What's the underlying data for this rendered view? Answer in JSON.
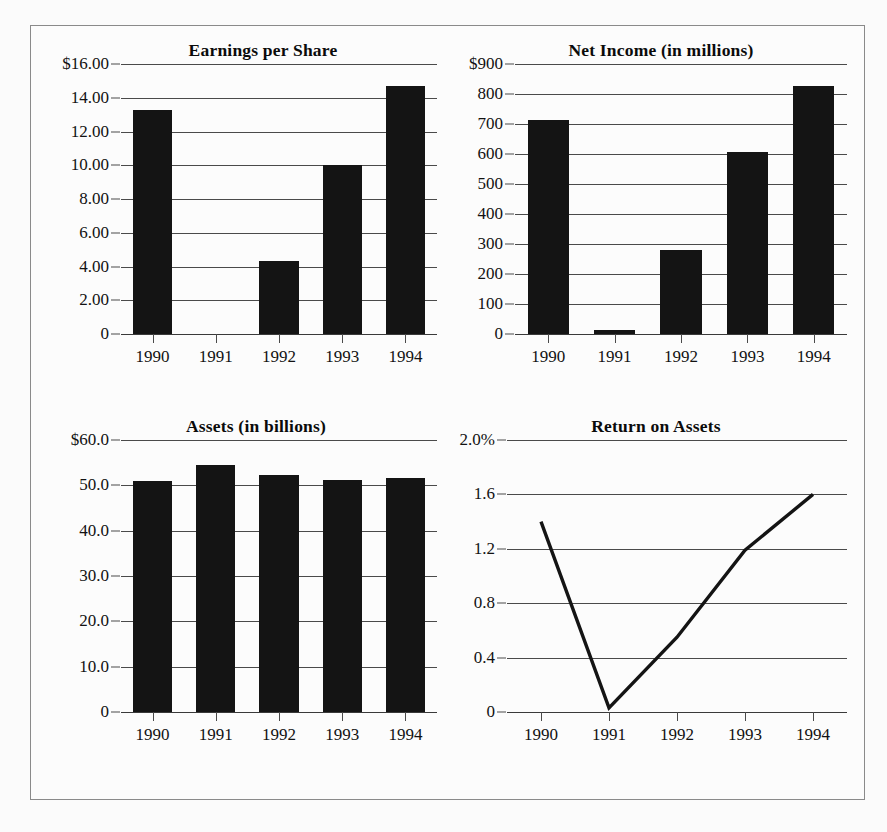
{
  "figure": {
    "panel_count": 4,
    "ink_color": "#141414",
    "grid_color": "#4a4a4a",
    "background": "#fbfbfb"
  },
  "charts": [
    {
      "id": "earnings-per-share",
      "title": "Earnings per Share",
      "type": "bar",
      "categories": [
        "1990",
        "1991",
        "1992",
        "1993",
        "1994"
      ],
      "values": [
        13.3,
        0,
        4.35,
        10.0,
        14.7
      ],
      "ytick_labels": [
        "$16.00",
        "14.00",
        "12.00",
        "10.00",
        "8.00",
        "6.00",
        "4.00",
        "2.00",
        "0"
      ],
      "ytick_values": [
        16,
        14,
        12,
        10,
        8,
        6,
        4,
        2,
        0
      ],
      "ylim": [
        0,
        16
      ],
      "xlabel": "",
      "ylabel": "",
      "grid": true
    },
    {
      "id": "net-income",
      "title": "Net Income (in millions)",
      "type": "bar",
      "categories": [
        "1990",
        "1991",
        "1992",
        "1993",
        "1994"
      ],
      "values": [
        715,
        15,
        280,
        608,
        828
      ],
      "ytick_labels": [
        "$900",
        "800",
        "700",
        "600",
        "500",
        "400",
        "300",
        "200",
        "100",
        "0"
      ],
      "ytick_values": [
        900,
        800,
        700,
        600,
        500,
        400,
        300,
        200,
        100,
        0
      ],
      "ylim": [
        0,
        900
      ],
      "xlabel": "",
      "ylabel": "",
      "grid": true
    },
    {
      "id": "assets",
      "title": "Assets (in billions)",
      "type": "bar",
      "categories": [
        "1990",
        "1991",
        "1992",
        "1993",
        "1994"
      ],
      "values": [
        51.0,
        54.5,
        52.3,
        51.1,
        51.7
      ],
      "ytick_labels": [
        "$60.0",
        "50.0",
        "40.0",
        "30.0",
        "20.0",
        "10.0",
        "0"
      ],
      "ytick_values": [
        60,
        50,
        40,
        30,
        20,
        10,
        0
      ],
      "ylim": [
        0,
        60
      ],
      "xlabel": "",
      "ylabel": "",
      "grid": true
    },
    {
      "id": "return-on-assets",
      "title": "Return on Assets",
      "type": "line",
      "categories": [
        "1990",
        "1991",
        "1992",
        "1993",
        "1994"
      ],
      "values": [
        1.4,
        0.03,
        0.55,
        1.19,
        1.6
      ],
      "ytick_labels": [
        "2.0%",
        "1.6",
        "1.2",
        "0.8",
        "0.4",
        "0"
      ],
      "ytick_values": [
        2.0,
        1.6,
        1.2,
        0.8,
        0.4,
        0
      ],
      "ylim": [
        0,
        2.0
      ],
      "xlabel": "",
      "ylabel": "",
      "grid": true
    }
  ],
  "chart_data": [
    {
      "type": "bar",
      "title": "Earnings per Share",
      "categories": [
        "1990",
        "1991",
        "1992",
        "1993",
        "1994"
      ],
      "values": [
        13.3,
        0,
        4.35,
        10.0,
        14.7
      ],
      "xlabel": "",
      "ylabel": "",
      "ylim": [
        0,
        16
      ],
      "ytick_labels": [
        "$16.00",
        "14.00",
        "12.00",
        "10.00",
        "8.00",
        "6.00",
        "4.00",
        "2.00",
        "0"
      ],
      "grid": true,
      "legend": null
    },
    {
      "type": "bar",
      "title": "Net Income (in millions)",
      "categories": [
        "1990",
        "1991",
        "1992",
        "1993",
        "1994"
      ],
      "values": [
        715,
        15,
        280,
        608,
        828
      ],
      "xlabel": "",
      "ylabel": "",
      "ylim": [
        0,
        900
      ],
      "ytick_labels": [
        "$900",
        "800",
        "700",
        "600",
        "500",
        "400",
        "300",
        "200",
        "100",
        "0"
      ],
      "grid": true,
      "legend": null
    },
    {
      "type": "bar",
      "title": "Assets (in billions)",
      "categories": [
        "1990",
        "1991",
        "1992",
        "1993",
        "1994"
      ],
      "values": [
        51.0,
        54.5,
        52.3,
        51.1,
        51.7
      ],
      "xlabel": "",
      "ylabel": "",
      "ylim": [
        0,
        60
      ],
      "ytick_labels": [
        "$60.0",
        "50.0",
        "40.0",
        "30.0",
        "20.0",
        "10.0",
        "0"
      ],
      "grid": true,
      "legend": null
    },
    {
      "type": "line",
      "title": "Return on Assets",
      "categories": [
        "1990",
        "1991",
        "1992",
        "1993",
        "1994"
      ],
      "values": [
        1.4,
        0.03,
        0.55,
        1.19,
        1.6
      ],
      "xlabel": "",
      "ylabel": "",
      "ylim": [
        0,
        2.0
      ],
      "ytick_labels": [
        "2.0%",
        "1.6",
        "1.2",
        "0.8",
        "0.4",
        "0"
      ],
      "grid": true,
      "legend": null
    }
  ]
}
